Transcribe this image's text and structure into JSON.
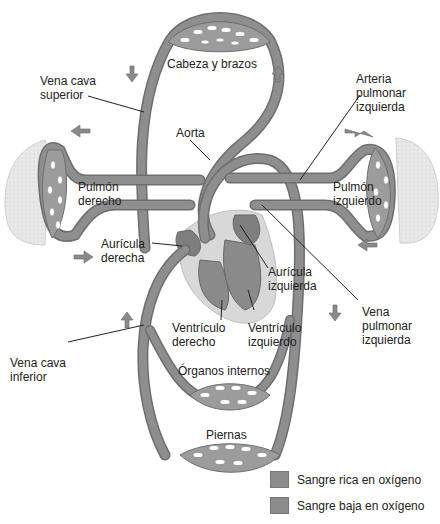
{
  "colors": {
    "vessel": "#8a8a8a",
    "vessel_dark": "#6d6d6d",
    "heart_bg": "#d8d8d8",
    "lung": "#e6e6e6",
    "capillary_bed": "#9a9a9a",
    "leader_line": "#222222",
    "oxygen_rich": "#8c8c8c",
    "oxygen_poor": "#8c8c8c"
  },
  "labels": {
    "cabeza_brazos": "Cabeza y brazos",
    "vena_cava_superior": "Vena cava\nsuperior",
    "arteria_pulmonar_izquierda": "Arteria\npulmonar\nizquierda",
    "aorta": "Aorta",
    "pulmon_derecho": "Pulmón\nderecho",
    "pulmon_izquierdo": "Pulmón\nizquierdo",
    "auricula_derecha": "Aurícula\nderecha",
    "auricula_izquierda": "Aurícula\nizquierda",
    "vena_pulmonar_izquierda": "Vena\npulmonar\nizquierda",
    "ventriculo_derecho": "Ventrículo\nderecho",
    "ventriculo_izquierdo": "Ventrículo\nizquierdo",
    "vena_cava_inferior": "Vena cava\ninferior",
    "organos_internos": "Órganos internos",
    "piernas": "Piernas"
  },
  "legend": [
    {
      "label": "Sangre rica en oxígeno",
      "color": "#8c8c8c"
    },
    {
      "label": "Sangre baja en oxígeno",
      "color": "#8c8c8c"
    }
  ],
  "flow_arrows": [
    {
      "name": "arrow-down-upper-left",
      "direction": "down"
    },
    {
      "name": "arrow-up-upper-right",
      "direction": "up"
    },
    {
      "name": "arrow-left-upper-left",
      "direction": "left"
    },
    {
      "name": "arrow-right-upper-right",
      "direction": "right"
    },
    {
      "name": "arrow-right-lower-left",
      "direction": "right"
    },
    {
      "name": "arrow-left-lower-right",
      "direction": "left"
    },
    {
      "name": "arrow-up-lower-left",
      "direction": "up"
    },
    {
      "name": "arrow-down-lower-right",
      "direction": "down"
    }
  ]
}
